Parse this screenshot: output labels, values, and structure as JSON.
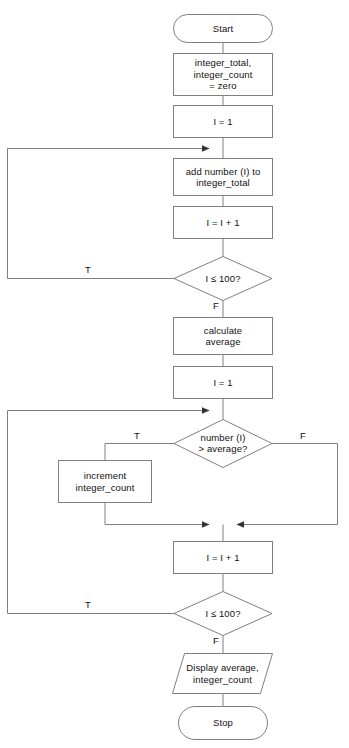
{
  "diagram": {
    "type": "flowchart",
    "canvas": {
      "width": 349,
      "height": 748
    },
    "style": {
      "stroke_color": "#808080",
      "fill_color": "#ffffff",
      "text_color": "#111111",
      "stroke_width": 1
    },
    "nodes": [
      {
        "id": "start",
        "shape": "terminator",
        "label": "Start",
        "x": 173,
        "y": 14,
        "w": 100,
        "h": 29
      },
      {
        "id": "init",
        "shape": "process",
        "label": "integer_total,\ninteger_count\n= zero",
        "x": 173,
        "y": 53,
        "w": 100,
        "h": 43
      },
      {
        "id": "set_i_1_a",
        "shape": "process",
        "label": "I = 1",
        "x": 173,
        "y": 105,
        "w": 100,
        "h": 33
      },
      {
        "id": "add_number",
        "shape": "process",
        "label": "add number (I) to\ninteger_total",
        "x": 173,
        "y": 158,
        "w": 100,
        "h": 38
      },
      {
        "id": "inc_i_a",
        "shape": "process",
        "label": "I = I + 1",
        "x": 173,
        "y": 206,
        "w": 100,
        "h": 33
      },
      {
        "id": "test_i_a",
        "shape": "decision",
        "label": "I ≤ 100?",
        "x": 174,
        "y": 256,
        "w": 98,
        "h": 45
      },
      {
        "id": "calc_avg",
        "shape": "process",
        "label": "calculate\naverage",
        "x": 173,
        "y": 317,
        "w": 100,
        "h": 38
      },
      {
        "id": "set_i_1_b",
        "shape": "process",
        "label": "I = 1",
        "x": 173,
        "y": 366,
        "w": 100,
        "h": 33
      },
      {
        "id": "test_gt_avg",
        "shape": "decision",
        "label": "number (I)\n> average?",
        "x": 174,
        "y": 419,
        "w": 98,
        "h": 48
      },
      {
        "id": "increment_count",
        "shape": "process",
        "label": "increment\ninteger_count",
        "x": 58,
        "y": 460,
        "w": 94,
        "h": 43
      },
      {
        "id": "inc_i_b",
        "shape": "process",
        "label": "I = I + 1",
        "x": 173,
        "y": 541,
        "w": 100,
        "h": 33
      },
      {
        "id": "test_i_b",
        "shape": "decision",
        "label": "I ≤ 100?",
        "x": 174,
        "y": 591,
        "w": 98,
        "h": 45
      },
      {
        "id": "display",
        "shape": "input-output",
        "label": "Display average,\ninteger_count",
        "x": 172,
        "y": 653,
        "w": 101,
        "h": 41
      },
      {
        "id": "stop",
        "shape": "terminator",
        "label": "Stop",
        "x": 178,
        "y": 706,
        "w": 90,
        "h": 34
      }
    ],
    "edge_labels": [
      {
        "id": "t-loop-1",
        "text": "T",
        "x": 88,
        "y": 266
      },
      {
        "id": "f-test-1",
        "text": "F",
        "x": 215,
        "y": 302
      },
      {
        "id": "t-gt-avg",
        "text": "T",
        "x": 137,
        "y": 433
      },
      {
        "id": "f-gt-avg",
        "text": "F",
        "x": 303,
        "y": 433
      },
      {
        "id": "t-loop-2",
        "text": "T",
        "x": 88,
        "y": 600
      },
      {
        "id": "f-test-2",
        "text": "F",
        "x": 215,
        "y": 637
      }
    ],
    "connectors": [
      {
        "id": "start-to-init",
        "from": "start",
        "to": "init"
      },
      {
        "id": "init-to-set-i-1a",
        "from": "init",
        "to": "set_i_1_a"
      },
      {
        "id": "set-i-1a-to-add",
        "from": "set_i_1_a",
        "to": "add_number"
      },
      {
        "id": "add-to-inc-i-a",
        "from": "add_number",
        "to": "inc_i_a"
      },
      {
        "id": "inc-i-a-to-test-a",
        "from": "inc_i_a",
        "to": "test_i_a"
      },
      {
        "id": "test-a-true-loopback",
        "from": "test_i_a",
        "to": "add_number",
        "label": "T"
      },
      {
        "id": "test-a-false-to-calc",
        "from": "test_i_a",
        "to": "calc_avg",
        "label": "F"
      },
      {
        "id": "calc-to-set-i-1b",
        "from": "calc_avg",
        "to": "set_i_1_b"
      },
      {
        "id": "set-i-1b-to-test-gt",
        "from": "set_i_1_b",
        "to": "test_gt_avg"
      },
      {
        "id": "test-gt-true-to-increment",
        "from": "test_gt_avg",
        "to": "increment_count",
        "label": "T"
      },
      {
        "id": "test-gt-false-to-merge",
        "from": "test_gt_avg",
        "to": "inc_i_b",
        "label": "F"
      },
      {
        "id": "increment-to-merge",
        "from": "increment_count",
        "to": "inc_i_b"
      },
      {
        "id": "inc-i-b-to-test-b",
        "from": "inc_i_b",
        "to": "test_i_b"
      },
      {
        "id": "test-b-true-loopback",
        "from": "test_i_b",
        "to": "test_gt_avg",
        "label": "T"
      },
      {
        "id": "test-b-false-to-display",
        "from": "test_i_b",
        "to": "display",
        "label": "F"
      },
      {
        "id": "display-to-stop",
        "from": "display",
        "to": "stop"
      }
    ]
  }
}
